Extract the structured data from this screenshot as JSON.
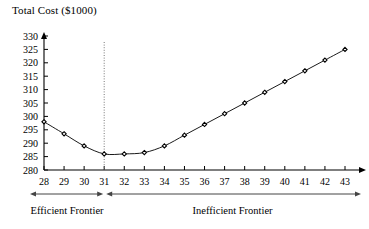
{
  "chart_data": {
    "type": "line",
    "title": "Total Cost ($1000)",
    "xlabel": "",
    "ylabel": "Total Cost ($1000)",
    "xlim": [
      28,
      43
    ],
    "ylim": [
      280,
      330
    ],
    "grid": false,
    "legend_position": "none",
    "x": [
      28,
      29,
      30,
      31,
      32,
      33,
      34,
      35,
      36,
      37,
      38,
      39,
      40,
      41,
      42,
      43
    ],
    "values": [
      298.0,
      293.5,
      289.0,
      286.0,
      286.0,
      286.5,
      289.0,
      293.0,
      297.0,
      301.0,
      305.0,
      309.0,
      313.0,
      317.0,
      321.0,
      325.0
    ],
    "series": [
      {
        "name": "Total Cost",
        "values": [
          298.0,
          293.5,
          289.0,
          286.0,
          286.0,
          286.5,
          289.0,
          293.0,
          297.0,
          301.0,
          305.0,
          309.0,
          313.0,
          317.0,
          321.0,
          325.0
        ]
      }
    ],
    "ytick_labels": [
      "280",
      "285",
      "290",
      "295",
      "300",
      "305",
      "310",
      "315",
      "320",
      "325",
      "330"
    ],
    "ytick_values": [
      280,
      285,
      290,
      295,
      300,
      305,
      310,
      315,
      320,
      325,
      330
    ],
    "xtick_labels": [
      "28",
      "29",
      "30",
      "31",
      "32",
      "33",
      "34",
      "35",
      "36",
      "37",
      "38",
      "39",
      "40",
      "41",
      "42",
      "43"
    ],
    "xtick_values": [
      28,
      29,
      30,
      31,
      32,
      33,
      34,
      35,
      36,
      37,
      38,
      39,
      40,
      41,
      42,
      43
    ],
    "annotations": [
      {
        "name": "divider",
        "type": "vertical-dotted-line",
        "x": 31
      },
      {
        "name": "efficient-frontier",
        "label": "Efficient Frontier",
        "range": [
          28,
          31
        ]
      },
      {
        "name": "inefficient-frontier",
        "label": "Inefficient Frontier",
        "range": [
          31,
          43
        ]
      }
    ],
    "marker": "diamond",
    "line_color": "#000000",
    "marker_color": "#000000"
  },
  "labels": {
    "axis_title": "Total Cost ($1000)",
    "efficient_frontier": "Efficient Frontier",
    "inefficient_frontier": "Inefficient Frontier"
  },
  "colors": {
    "line": "#000000",
    "text": "#000000",
    "axis": "#000000",
    "divider": "#777777",
    "frontier_arrow": "#444444"
  }
}
